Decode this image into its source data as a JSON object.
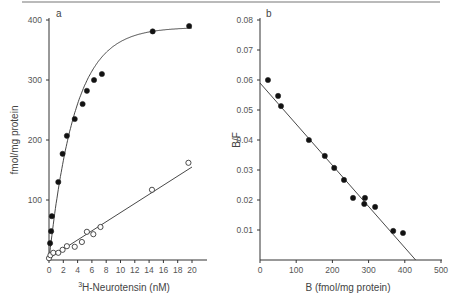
{
  "chart_data": [
    {
      "type": "scatter",
      "panel_label": "a",
      "title": "",
      "xlabel": "³H-Neurotensin (nM)",
      "ylabel": "fmol/mg protein",
      "xlim": [
        0,
        22
      ],
      "ylim": [
        0,
        400
      ],
      "xticks": [
        0,
        2,
        4,
        6,
        8,
        10,
        12,
        14,
        16,
        18,
        20
      ],
      "yticks": [
        100,
        200,
        300,
        400
      ],
      "grid": false,
      "series": [
        {
          "name": "total binding",
          "marker": "filled-circle",
          "fit": "saturation curve",
          "x": [
            0.15,
            0.3,
            0.4,
            1.3,
            1.9,
            2.5,
            3.6,
            4.7,
            5.3,
            6.3,
            7.4,
            14.5,
            19.6
          ],
          "y": [
            28,
            48,
            73,
            130,
            177,
            207,
            235,
            260,
            282,
            300,
            310,
            381,
            390
          ]
        },
        {
          "name": "nonspecific binding",
          "marker": "open-circle",
          "fit": "linear",
          "x": [
            0.0,
            0.2,
            0.6,
            1.3,
            1.9,
            2.5,
            3.6,
            4.6,
            5.3,
            6.2,
            7.2,
            14.4,
            19.5
          ],
          "y": [
            3,
            8,
            12,
            12,
            17,
            23,
            22,
            30,
            47,
            43,
            55,
            117,
            162
          ]
        }
      ]
    },
    {
      "type": "scatter",
      "panel_label": "b",
      "title": "",
      "xlabel": "B (fmol/mg protein)",
      "ylabel": "B/F",
      "xlim": [
        0,
        500
      ],
      "ylim": [
        0,
        0.08
      ],
      "xticks": [
        0,
        100,
        200,
        300,
        400,
        500
      ],
      "yticks": [
        0.01,
        0.02,
        0.03,
        0.04,
        0.05,
        0.06,
        0.07,
        0.08
      ],
      "grid": false,
      "series": [
        {
          "name": "Scatchard plot",
          "marker": "filled-circle",
          "fit": "linear",
          "fit_line": {
            "x": [
              0,
              430
            ],
            "y": [
              0.059,
              0.0
            ]
          },
          "x": [
            22,
            50,
            58,
            135,
            179,
            205,
            232,
            257,
            290,
            288,
            318,
            368,
            395
          ],
          "y": [
            0.06,
            0.0547,
            0.0513,
            0.04,
            0.0347,
            0.0307,
            0.0267,
            0.0207,
            0.0207,
            0.0187,
            0.0177,
            0.0097,
            0.009
          ]
        }
      ]
    }
  ],
  "labels": {
    "a_panel": "a",
    "a_xlabel": "H-Neurotensin (nM)",
    "a_xlabel_sup": "3",
    "a_ylabel": "fmol/mg protein",
    "a_xticks": [
      "0",
      "2",
      "4",
      "6",
      "8",
      "10",
      "12",
      "14",
      "16",
      "18",
      "20"
    ],
    "a_yticks": [
      "100",
      "200",
      "300",
      "400"
    ],
    "b_panel": "b",
    "b_xlabel": "B (fmol/mg protein)",
    "b_ylabel": "B/F",
    "b_xticks": [
      "0",
      "100",
      "200",
      "300",
      "400",
      "500"
    ],
    "b_yticks": [
      "0.01",
      "0.02",
      "0.03",
      "0.04",
      "0.05",
      "0.06",
      "0.07",
      "0.08"
    ]
  }
}
